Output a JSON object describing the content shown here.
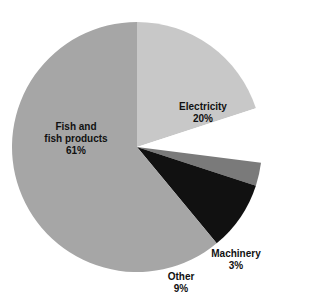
{
  "chart_data": {
    "type": "pie",
    "title": "",
    "start_angle_deg": 0,
    "direction": "clockwise",
    "slices": [
      {
        "label": "Electricity",
        "value": 20,
        "display": "20%",
        "color": "#c8c8c8"
      },
      {
        "label": "Precious metals",
        "value": 7,
        "display": "7%",
        "color": "#ffffff"
      },
      {
        "label": "Machinery",
        "value": 3,
        "display": "3%",
        "color": "#7a7a7a"
      },
      {
        "label": "Other",
        "value": 9,
        "display": "9%",
        "color": "#111111"
      },
      {
        "label": "Fish and fish products",
        "value": 61,
        "display": "61%",
        "color": "#a6a6a6"
      }
    ]
  },
  "labels": {
    "electricity": {
      "line1": "Electricity",
      "line2": "20%"
    },
    "precious": {
      "line1": "Precious",
      "line2": "metals",
      "line3": "7%"
    },
    "machinery": {
      "line1": "Machinery",
      "line2": "3%"
    },
    "other": {
      "line1": "Other",
      "line2": "9%"
    },
    "fish": {
      "line1": "Fish and",
      "line2": "fish products",
      "line3": "61%"
    }
  }
}
